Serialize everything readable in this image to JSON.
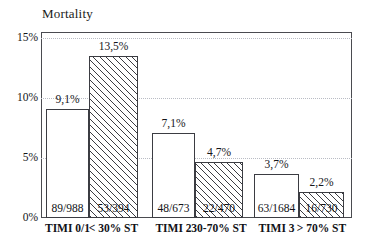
{
  "chart_data": {
    "type": "bar",
    "title": "Mortality",
    "xlabel": "",
    "ylabel": "",
    "ylim": [
      0,
      15
    ],
    "grid": true,
    "legend": null,
    "ytick_labels": [
      "0%",
      "5%",
      "10%",
      "15%"
    ],
    "ytick_values": [
      0,
      5,
      10,
      15
    ],
    "categories": [
      "TIMI 0/1",
      "< 30% ST",
      "TIMI 2",
      "30-70% ST",
      "TIMI 3",
      "> 70% ST"
    ],
    "values": [
      9.1,
      13.5,
      7.1,
      4.7,
      3.7,
      2.2
    ],
    "value_labels": [
      "9,1%",
      "13,5%",
      "7,1%",
      "4,7%",
      "3,7%",
      "2,2%"
    ],
    "fraction_labels": [
      "89/988",
      "53/394",
      "48/673",
      "22/470",
      "63/1684",
      "16/730"
    ],
    "bar_styles": [
      "open",
      "hatched",
      "open",
      "hatched",
      "open",
      "hatched"
    ],
    "groups": [
      {
        "name": "Group 1",
        "bars": [
          0,
          1
        ]
      },
      {
        "name": "Group 2",
        "bars": [
          2,
          3
        ]
      },
      {
        "name": "Group 3",
        "bars": [
          4,
          5
        ]
      }
    ]
  },
  "geometry": {
    "plot_left": 41,
    "plot_top": 32,
    "plot_width": 311,
    "plot_height": 186,
    "baseline_y": 186,
    "px_per_percent": 12,
    "bars": [
      {
        "x": 5,
        "w": 43
      },
      {
        "x": 48,
        "w": 49
      },
      {
        "x": 111,
        "w": 43
      },
      {
        "x": 154,
        "w": 48
      },
      {
        "x": 213,
        "w": 45
      },
      {
        "x": 258,
        "w": 45
      }
    ]
  }
}
